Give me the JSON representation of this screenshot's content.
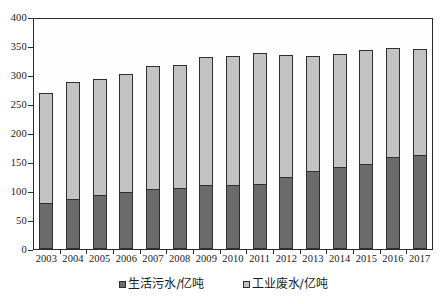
{
  "chart_data": {
    "type": "bar",
    "stacked": true,
    "title": "",
    "xlabel": "",
    "ylabel": "",
    "ylim": [
      0,
      400
    ],
    "ytick_values": [
      0,
      50,
      100,
      150,
      200,
      250,
      300,
      350,
      400
    ],
    "ytick_labels": [
      "0",
      "50",
      "100",
      "150",
      "200",
      "250",
      "300",
      "350",
      "400"
    ],
    "grid": false,
    "legend_position": "bottom",
    "categories": [
      "2003",
      "2004",
      "2005",
      "2006",
      "2007",
      "2008",
      "2009",
      "2010",
      "2011",
      "2012",
      "2013",
      "2014",
      "2015",
      "2016",
      "2017"
    ],
    "series": [
      {
        "name": "生活污水/亿吨",
        "color": "#6b6b6b",
        "values": [
          79,
          86,
          93,
          98,
          103,
          105,
          110,
          110,
          112,
          124,
          134,
          141,
          147,
          159,
          162
        ]
      },
      {
        "name": "工业废水/亿吨",
        "color": "#c3c3c3",
        "values": [
          192,
          204,
          202,
          205,
          214,
          214,
          222,
          224,
          228,
          212,
          200,
          197,
          198,
          189,
          185
        ]
      }
    ],
    "totals": [
      271,
      290,
      295,
      303,
      317,
      319,
      332,
      334,
      340,
      336,
      334,
      338,
      345,
      348,
      347
    ]
  },
  "legend": {
    "items": [
      {
        "label": "生活污水/亿吨",
        "swatch_color": "#6b6b6b",
        "icon": "square-marker-icon"
      },
      {
        "label": "工业废水/亿吨",
        "swatch_color": "#c3c3c3",
        "icon": "square-marker-icon"
      }
    ]
  },
  "colors": {
    "domestic_sewage": "#6b6b6b",
    "industrial_wastewater": "#c3c3c3",
    "axis": "#2b2b2b",
    "background": "#ffffff"
  }
}
